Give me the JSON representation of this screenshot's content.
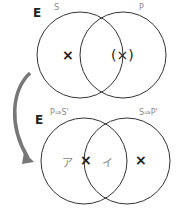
{
  "top": {
    "universe": "E",
    "left_label": "S",
    "right_label": "P",
    "mark_left": "×",
    "mark_right": "(×)"
  },
  "bottom": {
    "universe": "E",
    "left_label": "P⇒S'",
    "right_label": "S⇒P'",
    "region_a": "ア",
    "region_b": "イ",
    "mark_center": "×",
    "mark_right": "×"
  },
  "colors": {
    "stroke": "#333333",
    "arrow": "#666666",
    "label": "#8a8a8a"
  }
}
